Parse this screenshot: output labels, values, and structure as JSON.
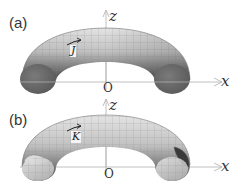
{
  "figure": {
    "panels": [
      {
        "label": "(a)",
        "vector_label": "J",
        "axis_z": "z",
        "axis_x": "x",
        "origin": "O",
        "end_caps": "solid"
      },
      {
        "label": "(b)",
        "vector_label": "K",
        "axis_z": "z",
        "axis_x": "x",
        "origin": "O",
        "end_caps": "open"
      }
    ],
    "colors": {
      "surface_light": "#d6d6d6",
      "surface_dark": "#555555",
      "cap_fill": "#6e6e6e",
      "axis": "#aaaaaa",
      "grid": "#9a9a9a"
    }
  }
}
